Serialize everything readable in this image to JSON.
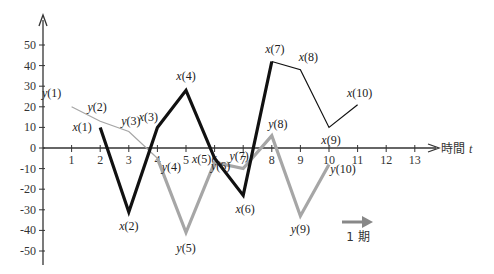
{
  "chart_data": {
    "type": "line",
    "title": "",
    "xlabel": "時間 t",
    "xlabel_text": "時間",
    "xlabel_var": "t",
    "ylabel": "",
    "xlim": [
      0,
      13.8
    ],
    "ylim": [
      -55,
      58
    ],
    "grid": false,
    "legend": "none",
    "x_ticks": [
      1,
      2,
      3,
      4,
      5,
      6,
      7,
      8,
      9,
      10,
      11,
      12,
      13
    ],
    "x_tick_labels": [
      "1",
      "2",
      "3",
      "4",
      "5",
      "6",
      "7",
      "8",
      "9",
      "10",
      "11",
      "12",
      "13"
    ],
    "y_ticks": [
      50,
      40,
      30,
      20,
      10,
      0,
      -10,
      -20,
      -30,
      -40,
      -50
    ],
    "y_tick_labels": [
      "50",
      "40",
      "30",
      "20",
      "10",
      "0",
      "-10",
      "-20",
      "-30",
      "-40",
      "-50"
    ],
    "series": [
      {
        "name": "x",
        "color": "#111111",
        "segments": [
          {
            "x": [
              2,
              3,
              4,
              5,
              6,
              7,
              8
            ],
            "values": [
              10,
              -31,
              10,
              28,
              -5,
              -23,
              42
            ],
            "width": 3.2
          },
          {
            "x": [
              8,
              9,
              10,
              11
            ],
            "values": [
              42,
              38,
              10,
              21
            ],
            "width": 1.2
          }
        ],
        "points": [
          {
            "t": 2,
            "label": "x(1)",
            "value": 10
          },
          {
            "t": 3,
            "label": "x(2)",
            "value": -31
          },
          {
            "t": 4,
            "label": "x(3)",
            "value": 10
          },
          {
            "t": 5,
            "label": "x(4)",
            "value": 28
          },
          {
            "t": 6,
            "label": "x(5)",
            "value": -5
          },
          {
            "t": 7,
            "label": "x(6)",
            "value": -23
          },
          {
            "t": 8,
            "label": "x(7)",
            "value": 42
          },
          {
            "t": 9,
            "label": "x(8)",
            "value": 38
          },
          {
            "t": 10,
            "label": "x(9)",
            "value": 10
          },
          {
            "t": 11,
            "label": "x(10)",
            "value": 21
          }
        ]
      },
      {
        "name": "y",
        "color": "#a6a6a6",
        "segments": [
          {
            "x": [
              1,
              2,
              3,
              4
            ],
            "values": [
              20,
              13,
              8,
              -5
            ],
            "width": 1.2
          },
          {
            "x": [
              4,
              5,
              6,
              7,
              8,
              9,
              10
            ],
            "values": [
              -5,
              -41,
              -7,
              -10,
              6,
              -33,
              -8
            ],
            "width": 3.2
          }
        ],
        "points": [
          {
            "t": 1,
            "label": "y(1)",
            "value": 20
          },
          {
            "t": 2,
            "label": "y(2)",
            "value": 13
          },
          {
            "t": 3,
            "label": "y(3)",
            "value": 8
          },
          {
            "t": 4,
            "label": "y(4)",
            "value": -5
          },
          {
            "t": 5,
            "label": "y(5)",
            "value": -41
          },
          {
            "t": 6,
            "label": "y(6)",
            "value": -7
          },
          {
            "t": 7,
            "label": "y(7)",
            "value": -10
          },
          {
            "t": 8,
            "label": "y(8)",
            "value": 6
          },
          {
            "t": 9,
            "label": "y(9)",
            "value": -33
          },
          {
            "t": 10,
            "label": "y(10)",
            "value": -8
          }
        ]
      }
    ],
    "annotations": [
      {
        "type": "arrow",
        "label": "1 期",
        "color": "#888888",
        "note": "one period"
      }
    ]
  },
  "point_labels": {
    "x": [
      "x(1)",
      "x(2)",
      "x(3)",
      "x(4)",
      "x(5)",
      "x(6)",
      "x(7)",
      "x(8)",
      "x(9)",
      "x(10)"
    ],
    "y": [
      "y(1)",
      "y(2)",
      "y(3)",
      "y(4)",
      "y(5)",
      "y(6)",
      "y(7)",
      "y(8)",
      "y(9)",
      "y(10)"
    ]
  },
  "period_label": "1 期"
}
